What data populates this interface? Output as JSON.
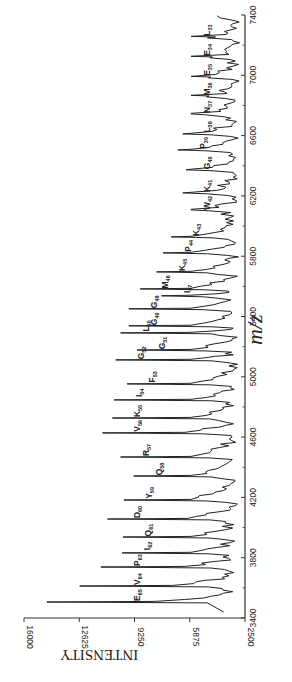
{
  "chart_data": {
    "type": "line",
    "subtype": "mass-spectrum",
    "orientation": "rotated-90-ccw",
    "title": "",
    "xlabel": "m/z",
    "ylabel": "INTENSITY",
    "xlim": [
      3400,
      7400
    ],
    "ylim": [
      2500,
      16000
    ],
    "xticks": [
      3400,
      3800,
      4200,
      4600,
      5000,
      5400,
      5800,
      6200,
      6600,
      7000,
      7400
    ],
    "yticks": [
      2500,
      5875,
      9250,
      12625,
      16000
    ],
    "ytick_labels": [
      "2500",
      "5875",
      "9250",
      "12625",
      "16000"
    ],
    "xtick_labels": [
      "3400",
      "3800",
      "4200",
      "4600",
      "5000",
      "5400",
      "5800",
      "6200",
      "6600",
      "7000",
      "7400"
    ],
    "grid": false,
    "legend": null,
    "baseline": 3300,
    "peaks": [
      {
        "label": "E",
        "sub": "65",
        "mz": 3506,
        "intensity": 14600
      },
      {
        "label": "V",
        "sub": "64",
        "mz": 3612,
        "intensity": 12600
      },
      {
        "label": "P",
        "sub": "63",
        "mz": 3738,
        "intensity": 11300
      },
      {
        "label": "I",
        "sub": "62",
        "mz": 3832,
        "intensity": 10000
      },
      {
        "label": "Q",
        "sub": "61",
        "mz": 3937,
        "intensity": 9950
      },
      {
        "label": "D",
        "sub": "60",
        "mz": 4057,
        "intensity": 10900
      },
      {
        "label": "Y",
        "sub": "59",
        "mz": 4183,
        "intensity": 9900
      },
      {
        "label": "Q",
        "sub": "58",
        "mz": 4342,
        "intensity": 9300
      },
      {
        "label": "R",
        "sub": "57",
        "mz": 4468,
        "intensity": 10100
      },
      {
        "label": "V",
        "sub": "56",
        "mz": 4628,
        "intensity": 11200
      },
      {
        "label": "K",
        "sub": "55",
        "mz": 4727,
        "intensity": 10600
      },
      {
        "label": "I",
        "sub": "54",
        "mz": 4847,
        "intensity": 10500
      },
      {
        "label": "F",
        "sub": "53",
        "mz": 4953,
        "intensity": 9700
      },
      {
        "label": "G",
        "sub": "52",
        "mz": 5112,
        "intensity": 10400
      },
      {
        "label": "G",
        "sub": "51",
        "mz": 5178,
        "intensity": 9100
      },
      {
        "label": "L",
        "sub": "50",
        "mz": 5291,
        "intensity": 10100
      },
      {
        "label": "G",
        "sub": "49",
        "mz": 5338,
        "intensity": 9600
      },
      {
        "label": "G",
        "sub": "48",
        "mz": 5451,
        "intensity": 9600
      },
      {
        "label": "I",
        "sub": "47",
        "mz": 5537,
        "intensity": 7600
      },
      {
        "label": "M",
        "sub": "46",
        "mz": 5583,
        "intensity": 8900
      },
      {
        "label": "K",
        "sub": "45",
        "mz": 5696,
        "intensity": 7900
      },
      {
        "label": "P",
        "sub": "44",
        "mz": 5822,
        "intensity": 7500
      },
      {
        "label": "K",
        "sub": "43",
        "mz": 5928,
        "intensity": 7000
      },
      {
        "label": "W",
        "sub": "42",
        "mz": 6107,
        "intensity": 5800
      },
      {
        "label": "K",
        "sub": "41",
        "mz": 6220,
        "intensity": 6300
      },
      {
        "label": "G",
        "sub": "40",
        "mz": 6373,
        "intensity": 6100
      },
      {
        "label": "P",
        "sub": "39",
        "mz": 6505,
        "intensity": 6600
      },
      {
        "label": "L",
        "sub": "38",
        "mz": 6611,
        "intensity": 6300
      },
      {
        "label": "N",
        "sub": "37",
        "mz": 6744,
        "intensity": 5800
      },
      {
        "label": "M",
        "sub": "36",
        "mz": 6863,
        "intensity": 4700
      },
      {
        "label": "E",
        "sub": "35",
        "mz": 6989,
        "intensity": 4600
      },
      {
        "label": "E",
        "sub": "34",
        "mz": 7122,
        "intensity": 4500
      },
      {
        "label": "L",
        "sub": "33",
        "mz": 7254,
        "intensity": 4300
      }
    ],
    "colors": {
      "line": "#222222",
      "axis": "#333333",
      "background": "#ffffff"
    }
  },
  "axes": {
    "x_label": "m/z",
    "y_label": "INTENSITY"
  }
}
